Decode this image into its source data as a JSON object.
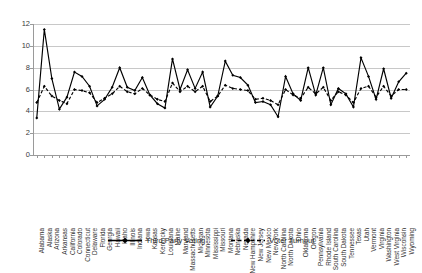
{
  "chart_data": {
    "type": "line",
    "title": "",
    "xlabel": "",
    "ylabel": "",
    "ylim": [
      0,
      12
    ],
    "ytick_values": [
      0,
      2,
      4,
      6,
      8,
      10,
      12
    ],
    "grid": true,
    "legend_position": "bottom",
    "categories": [
      "Alabama",
      "Alaska",
      "Arizona",
      "Arkansas",
      "California",
      "Colorado",
      "Connecticut",
      "Delaware",
      "Florida",
      "Georgia",
      "Hawaii",
      "Idaho",
      "Illinois",
      "Indiana",
      "Iowa",
      "Kansas",
      "Kentucky",
      "Louisiana",
      "Maine",
      "Maryland",
      "Massachusetts",
      "Michigan",
      "Minnesota",
      "Mississippi",
      "Missouri",
      "Montana",
      "Nebraska",
      "Nevada",
      "New Hampshire",
      "New Jersey",
      "New Mexico",
      "New York",
      "North Carolina",
      "North Dakota",
      "Ohio",
      "Oklahoma",
      "Oregon",
      "Pennsylvania",
      "Rhode Island",
      "South Carolina",
      "South Dakota",
      "Tennessee",
      "Texas",
      "Utah",
      "Vermont",
      "Virginia",
      "Washington",
      "West Virginia",
      "Wisconsin",
      "Wyoming"
    ],
    "series": [
      {
        "name": "Third Party Voting",
        "style": "solid",
        "marker": "diamond",
        "color": "#000000",
        "values": [
          3.4,
          11.5,
          7.0,
          4.2,
          5.3,
          7.6,
          7.2,
          6.3,
          4.5,
          5.1,
          6.2,
          8.0,
          6.2,
          5.9,
          7.1,
          5.5,
          4.7,
          4.3,
          8.8,
          6.0,
          7.8,
          6.1,
          7.6,
          4.4,
          5.4,
          8.6,
          7.3,
          7.1,
          6.4,
          4.8,
          4.9,
          4.6,
          3.5,
          7.2,
          5.6,
          5.0,
          8.0,
          5.5,
          8.0,
          4.6,
          6.1,
          5.6,
          4.4,
          8.9,
          7.2,
          5.1,
          7.9,
          5.2,
          6.7,
          7.5
        ]
      },
      {
        "name": "Voter Turnout",
        "style": "dashed",
        "marker": "diamond",
        "color": "#000000",
        "values": [
          4.8,
          6.3,
          5.4,
          5.0,
          4.7,
          6.0,
          5.9,
          5.7,
          4.8,
          5.2,
          5.6,
          6.3,
          5.8,
          5.6,
          6.1,
          5.5,
          5.1,
          4.9,
          6.6,
          5.8,
          6.3,
          5.8,
          6.3,
          4.9,
          5.4,
          6.4,
          6.1,
          6.0,
          5.9,
          5.1,
          5.2,
          5.0,
          4.6,
          6.0,
          5.5,
          5.2,
          6.2,
          5.6,
          6.2,
          5.0,
          5.8,
          5.5,
          4.8,
          6.1,
          6.3,
          5.3,
          6.3,
          5.4,
          6.0,
          6.0
        ]
      }
    ]
  },
  "legend": {
    "entries": [
      {
        "label": "Third Party Voting"
      },
      {
        "label": "Voter Turnout"
      }
    ]
  }
}
